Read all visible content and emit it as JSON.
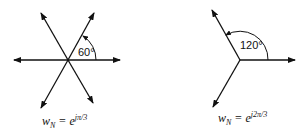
{
  "diagrams": [
    {
      "name": "sixth-roots",
      "angle_label": "60°",
      "equation": {
        "w": "w",
        "sub": "N",
        "eq": " = e",
        "exp": "jπ/3"
      },
      "directions_deg": [
        0,
        60,
        120,
        180,
        240,
        300
      ]
    },
    {
      "name": "cube-roots",
      "angle_label": "120°",
      "equation": {
        "w": "w",
        "sub": "N",
        "eq": " = e",
        "exp": "j2π/3"
      },
      "directions_deg": [
        0,
        120,
        240
      ]
    }
  ],
  "colors": {
    "ink": "#111111",
    "background": "#ffffff"
  }
}
